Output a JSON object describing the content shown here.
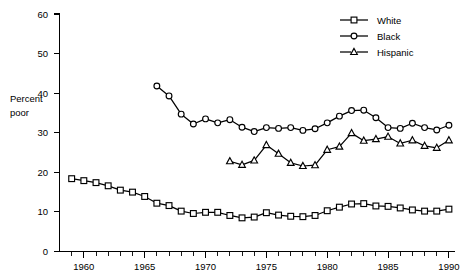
{
  "chart_data": {
    "type": "line",
    "title": "",
    "xlabel": "",
    "ylabel": "Percent poor",
    "xlim": [
      1958,
      1990.5
    ],
    "ylim": [
      0,
      60
    ],
    "grid": false,
    "legend_position": "top-right",
    "x_tick_labels": [
      "1960",
      "1965",
      "1970",
      "1975",
      "1980",
      "1985",
      "1990"
    ],
    "x_tick_values": [
      1960,
      1965,
      1970,
      1975,
      1980,
      1985,
      1990
    ],
    "x_minor_step": 1,
    "y_tick_labels": [
      "0",
      "10",
      "20",
      "30",
      "40",
      "50",
      "60"
    ],
    "y_tick_values": [
      0,
      10,
      20,
      30,
      40,
      50,
      60
    ],
    "series": [
      {
        "name": "White",
        "marker": "square",
        "color": "#000000",
        "x": [
          1959,
          1960,
          1961,
          1962,
          1963,
          1964,
          1965,
          1966,
          1967,
          1968,
          1969,
          1970,
          1971,
          1972,
          1973,
          1974,
          1975,
          1976,
          1977,
          1978,
          1979,
          1980,
          1981,
          1982,
          1983,
          1984,
          1985,
          1986,
          1987,
          1988,
          1989,
          1990
        ],
        "values": [
          18.4,
          17.9,
          17.4,
          16.6,
          15.5,
          15.0,
          13.9,
          12.2,
          11.6,
          10.2,
          9.6,
          9.9,
          9.9,
          9.1,
          8.5,
          8.7,
          9.8,
          9.2,
          8.9,
          8.8,
          9.1,
          10.3,
          11.2,
          12.0,
          12.1,
          11.5,
          11.4,
          11.0,
          10.5,
          10.2,
          10.2,
          10.7
        ]
      },
      {
        "name": "Black",
        "marker": "circle",
        "color": "#000000",
        "x": [
          1966,
          1967,
          1968,
          1969,
          1970,
          1971,
          1972,
          1973,
          1974,
          1975,
          1976,
          1977,
          1978,
          1979,
          1980,
          1981,
          1982,
          1983,
          1984,
          1985,
          1986,
          1987,
          1988,
          1989,
          1990
        ],
        "values": [
          41.8,
          39.3,
          34.7,
          32.2,
          33.5,
          32.5,
          33.3,
          31.4,
          30.3,
          31.3,
          31.1,
          31.3,
          30.6,
          31.0,
          32.5,
          34.2,
          35.6,
          35.7,
          33.8,
          31.3,
          31.1,
          32.4,
          31.3,
          30.7,
          31.9
        ]
      },
      {
        "name": "Hispanic",
        "marker": "triangle",
        "color": "#000000",
        "x": [
          1972,
          1973,
          1974,
          1975,
          1976,
          1977,
          1978,
          1979,
          1980,
          1981,
          1982,
          1983,
          1984,
          1985,
          1986,
          1987,
          1988,
          1989,
          1990
        ],
        "values": [
          22.8,
          21.9,
          23.0,
          26.9,
          24.7,
          22.4,
          21.6,
          21.8,
          25.7,
          26.5,
          29.9,
          28.0,
          28.4,
          29.0,
          27.3,
          28.1,
          26.7,
          26.2,
          28.1
        ]
      }
    ]
  },
  "legend": {
    "entries": [
      {
        "label": "White",
        "marker": "square"
      },
      {
        "label": "Black",
        "marker": "circle"
      },
      {
        "label": "Hispanic",
        "marker": "triangle"
      }
    ]
  },
  "axis": {
    "y_label_line1": "Percent",
    "y_label_line2": "poor"
  }
}
